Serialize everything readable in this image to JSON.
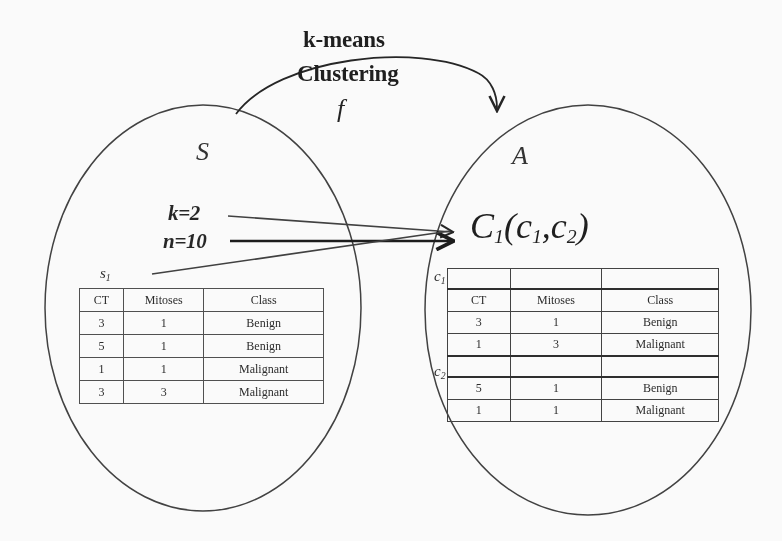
{
  "diagram": {
    "title_arc": {
      "line1": "k-means",
      "line2": "Clustering",
      "function_symbol": "f"
    },
    "sets": {
      "source": {
        "label": "S",
        "subset_tag": "s",
        "subset_index": "1"
      },
      "target": {
        "label": "A"
      }
    },
    "parameters": [
      {
        "name": "k",
        "text": "k=2"
      },
      {
        "name": "n",
        "text": "n=10"
      }
    ],
    "result_formula": {
      "main": "C",
      "main_sub": "1",
      "open": "(",
      "arg1": "c",
      "arg1_sub": "1",
      "comma": ",",
      "arg2": "c",
      "arg2_sub": "2",
      "close": ")"
    },
    "cluster_tags": [
      {
        "label": "c",
        "index": "1"
      },
      {
        "label": "c",
        "index": "2"
      }
    ],
    "source_table": {
      "headers": [
        "CT",
        "Mitoses",
        "Class"
      ],
      "rows": [
        [
          "3",
          "1",
          "Benign"
        ],
        [
          "5",
          "1",
          "Benign"
        ],
        [
          "1",
          "1",
          "Malignant"
        ],
        [
          "3",
          "3",
          "Malignant"
        ]
      ]
    },
    "cluster_table": {
      "headers": [
        "CT",
        "Mitoses",
        "Class"
      ],
      "cluster1_rows": [
        [
          "3",
          "1",
          "Benign"
        ],
        [
          "1",
          "3",
          "Malignant"
        ]
      ],
      "cluster2_rows": [
        [
          "5",
          "1",
          "Benign"
        ],
        [
          "1",
          "1",
          "Malignant"
        ]
      ]
    },
    "colors": {
      "ink": "#1a1a1a",
      "table_rule": "#4a4a4a",
      "background": "#ffffff"
    }
  }
}
